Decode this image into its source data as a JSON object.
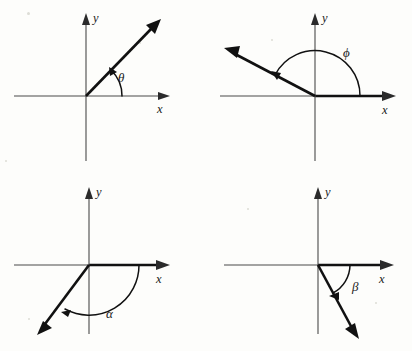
{
  "figure": {
    "background_color": "#fdfdfb",
    "axis_color": "#4a4a4a",
    "ray_color": "#111111",
    "panel_count": 4
  },
  "panels": [
    {
      "id": "theta",
      "angle_symbol": "θ",
      "angle_name": "theta",
      "x_axis_label": "x",
      "y_axis_label": "y",
      "ray_angle_deg": 46,
      "rotation_direction": "counterclockwise",
      "quadrant": 1,
      "arc_radius": 36
    },
    {
      "id": "phi",
      "angle_symbol": "ϕ",
      "angle_name": "phi",
      "x_axis_label": "x",
      "y_axis_label": "y",
      "ray_angle_deg": 152,
      "rotation_direction": "counterclockwise",
      "quadrant": 2,
      "arc_radius": 45
    },
    {
      "id": "alpha",
      "angle_symbol": "α",
      "angle_name": "alpha",
      "x_axis_label": "x",
      "y_axis_label": "y",
      "ray_angle_deg": -118,
      "rotation_direction": "clockwise",
      "quadrant": 3,
      "arc_radius": 50
    },
    {
      "id": "beta",
      "angle_symbol": "β",
      "angle_name": "beta",
      "x_axis_label": "x",
      "y_axis_label": "y",
      "ray_angle_deg": -63,
      "rotation_direction": "clockwise",
      "quadrant": 4,
      "arc_radius": 32
    }
  ]
}
